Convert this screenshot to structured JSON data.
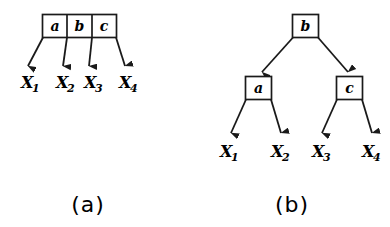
{
  "figure": {
    "background_color": "#ffffff",
    "stroke_color": "#1a1a1a",
    "panels": [
      {
        "id": "panel-a",
        "caption": "(a)",
        "type": "flat-record-node",
        "cells": [
          {
            "label": "a"
          },
          {
            "label": "b"
          },
          {
            "label": "c"
          }
        ],
        "leaves": [
          {
            "base": "X",
            "sub": "1"
          },
          {
            "base": "X",
            "sub": "2"
          },
          {
            "base": "X",
            "sub": "3"
          },
          {
            "base": "X",
            "sub": "4"
          }
        ],
        "arrow_count": 4
      },
      {
        "id": "panel-b",
        "caption": "(b)",
        "type": "binary-tree",
        "root": {
          "label": "b"
        },
        "children": [
          {
            "label": "a"
          },
          {
            "label": "c"
          }
        ],
        "leaves": [
          {
            "base": "X",
            "sub": "1"
          },
          {
            "base": "X",
            "sub": "2"
          },
          {
            "base": "X",
            "sub": "3"
          },
          {
            "base": "X",
            "sub": "4"
          }
        ],
        "arrow_count": 6
      }
    ]
  }
}
